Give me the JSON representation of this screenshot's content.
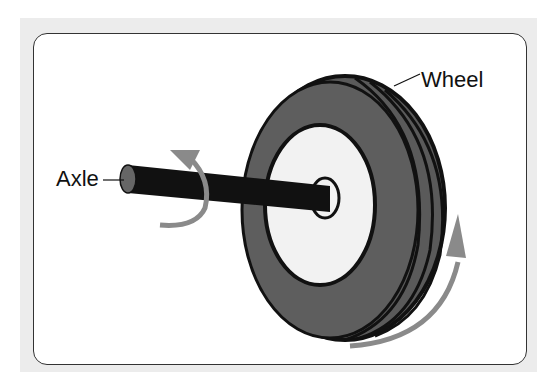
{
  "labels": {
    "axle": "Axle",
    "wheel": "Wheel"
  },
  "colors": {
    "background": "#ececec",
    "panel": "#ffffff",
    "tire": "#5a5a5a",
    "tire_outline": "#111111",
    "hub": "#f2f2f2",
    "axle": "#111111",
    "axle_end": "#666666",
    "rotation_arrow": "#8a8a8a"
  }
}
